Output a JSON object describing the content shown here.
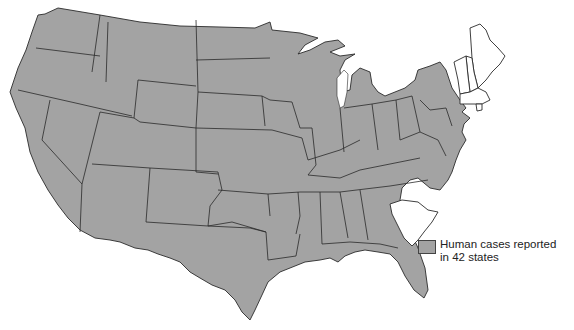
{
  "map": {
    "title": "",
    "region": "Contiguous United States",
    "colors": {
      "reported": "#a3a3a3",
      "not_reported": "#ffffff",
      "border": "#2a2a2a"
    },
    "states_not_reported": [
      "Maine",
      "New Hampshire",
      "Vermont",
      "Massachusetts",
      "Rhode Island",
      "South Carolina"
    ]
  },
  "legend": {
    "swatch_color": "#a3a3a3",
    "line1": "Human cases reported",
    "line2": "in 42 states"
  }
}
